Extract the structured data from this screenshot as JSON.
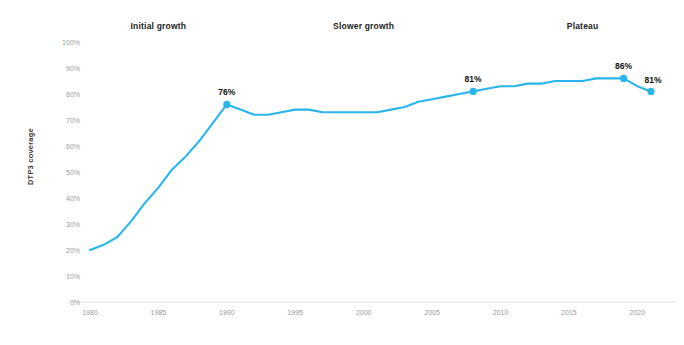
{
  "chart_data": {
    "type": "line",
    "title": "",
    "xlabel": "",
    "ylabel": "DTP3 coverage",
    "xlim": [
      1980,
      2021
    ],
    "ylim": [
      0,
      100
    ],
    "grid": false,
    "legend": "none",
    "line_color": "#29b6ec",
    "x_ticks": [
      "1980",
      "1985",
      "1990",
      "1995",
      "2000",
      "2005",
      "2010",
      "2015",
      "2020"
    ],
    "y_ticks": [
      "0%",
      "10%",
      "20%",
      "30%",
      "40%",
      "50%",
      "60%",
      "70%",
      "80%",
      "90%",
      "100%"
    ],
    "series": [
      {
        "name": "DTP3 coverage",
        "x": [
          1980,
          1981,
          1982,
          1983,
          1984,
          1985,
          1986,
          1987,
          1988,
          1989,
          1990,
          1991,
          1992,
          1993,
          1994,
          1995,
          1996,
          1997,
          1998,
          1999,
          2000,
          2001,
          2002,
          2003,
          2004,
          2005,
          2006,
          2007,
          2008,
          2009,
          2010,
          2011,
          2012,
          2013,
          2014,
          2015,
          2016,
          2017,
          2018,
          2019,
          2020,
          2021
        ],
        "values": [
          20,
          22,
          25,
          31,
          38,
          44,
          51,
          56,
          62,
          69,
          76,
          74,
          72,
          72,
          73,
          74,
          74,
          73,
          73,
          73,
          73,
          73,
          74,
          75,
          77,
          78,
          79,
          80,
          81,
          82,
          83,
          83,
          84,
          84,
          85,
          85,
          85,
          86,
          86,
          86,
          83,
          81
        ]
      }
    ],
    "annotations": [
      {
        "label": "76%",
        "x": 1990,
        "y": 76
      },
      {
        "label": "81%",
        "x": 2008,
        "y": 81
      },
      {
        "label": "86%",
        "x": 2019,
        "y": 86
      },
      {
        "label": "81%",
        "x": 2021,
        "y": 81
      }
    ],
    "phases": [
      {
        "label": "Initial growth",
        "x": 1985
      },
      {
        "label": "Slower growth",
        "x": 2000
      },
      {
        "label": "Plateau",
        "x": 2016
      }
    ]
  }
}
